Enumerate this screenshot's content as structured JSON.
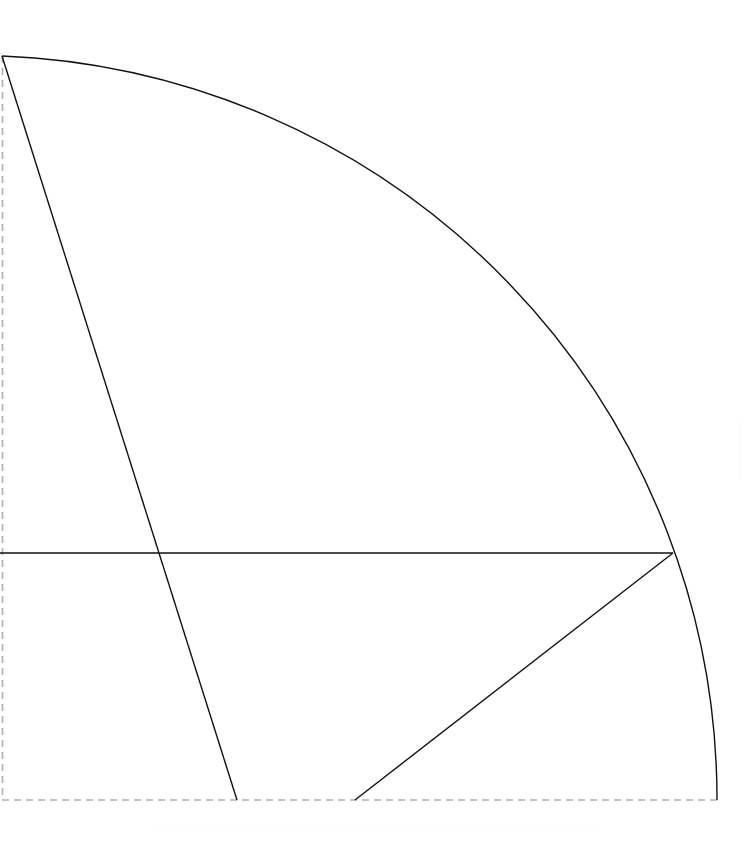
{
  "canvas": {
    "width": 751,
    "height": 858,
    "background_color": "#ffffff",
    "title": "Quarter-circle sector diagram"
  },
  "style": {
    "solid_stroke_color": "#111111",
    "solid_stroke_width": 1.4,
    "dashed_stroke_color": "#b0b0b0",
    "dashed_stroke_width": 1.6,
    "dashed_pattern": "7 5",
    "faint_stroke_color": "#fbfbfb"
  },
  "geometry": {
    "origin": {
      "x": 2,
      "y": 800,
      "label": "sector-center"
    },
    "apex": {
      "x": 2,
      "y": 56,
      "label": "arc-top"
    },
    "radius": 744,
    "junction": {
      "x": 673,
      "y": 553,
      "label": "arc-radius-junction"
    },
    "horizontal_line": {
      "x1": 0,
      "y1": 553,
      "x2": 673,
      "y2": 553
    },
    "radius_line_1": {
      "x1": 2,
      "y1": 56,
      "x2": 237,
      "y2": 800
    },
    "radius_line_2": {
      "x1": 355,
      "y1": 800,
      "x2": 673,
      "y2": 553
    },
    "arc": {
      "start": {
        "x": 2,
        "y": 56
      },
      "end": {
        "x": 717,
        "y": 800
      },
      "sweep": "clockwise",
      "large_arc": false
    },
    "intersections": [
      {
        "x": 158,
        "y": 553,
        "label": "horizontal-radius1-crossing"
      },
      {
        "x": 673,
        "y": 553,
        "label": "horizontal-arc-crossing"
      }
    ],
    "boundary_dashed": {
      "left": {
        "x1": 2,
        "y1": 56,
        "x2": 2,
        "y2": 800
      },
      "bottom": {
        "x1": 2,
        "y1": 800,
        "x2": 717,
        "y2": 800
      }
    },
    "faint_artifacts": [
      {
        "x1": 150,
        "y1": 826,
        "x2": 600,
        "y2": 826,
        "label": "faint-horizontal-smudge"
      },
      {
        "x1": 740,
        "y1": 420,
        "x2": 740,
        "y2": 480,
        "label": "faint-vertical-edge"
      }
    ]
  },
  "chart_data": {
    "type": "line",
    "xlabel": "",
    "ylabel": "",
    "xlim": [
      0,
      751
    ],
    "ylim": [
      858,
      0
    ],
    "grid": false,
    "legend": "none",
    "series": [
      {
        "name": "arc",
        "kind": "arc",
        "center": [
          2,
          800
        ],
        "radius": 744,
        "start_point": [
          2,
          56
        ],
        "end_point": [
          717,
          800
        ],
        "stroke": "#111111"
      },
      {
        "name": "horizontal-chord",
        "kind": "line",
        "points": [
          [
            0,
            553
          ],
          [
            673,
            553
          ]
        ],
        "stroke": "#111111"
      },
      {
        "name": "radius-line-left",
        "kind": "line",
        "points": [
          [
            2,
            56
          ],
          [
            237,
            800
          ]
        ],
        "stroke": "#111111"
      },
      {
        "name": "radius-line-right",
        "kind": "line",
        "points": [
          [
            355,
            800
          ],
          [
            673,
            553
          ]
        ],
        "stroke": "#111111"
      },
      {
        "name": "boundary-left-dashed",
        "kind": "line",
        "points": [
          [
            2,
            56
          ],
          [
            2,
            800
          ]
        ],
        "stroke": "#b0b0b0",
        "dashed": true
      },
      {
        "name": "boundary-bottom-dashed",
        "kind": "line",
        "points": [
          [
            2,
            800
          ],
          [
            717,
            800
          ]
        ],
        "stroke": "#b0b0b0",
        "dashed": true
      }
    ],
    "annotations": []
  }
}
